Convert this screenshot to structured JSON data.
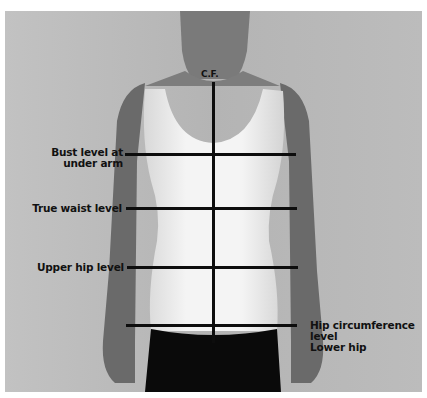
{
  "diagram": {
    "center_front_label": "C.F.",
    "levels": [
      {
        "id": "bust",
        "label_lines": [
          "Bust level at",
          "under arm"
        ]
      },
      {
        "id": "waist",
        "label_lines": [
          "True waist level"
        ]
      },
      {
        "id": "upper_hip",
        "label_lines": [
          "Upper hip level"
        ]
      },
      {
        "id": "hip",
        "label_lines": [
          "Hip circumference",
          "level",
          "Lower hip"
        ]
      }
    ]
  },
  "colors": {
    "background": "#bdbdbd",
    "line": "#0d0d0d",
    "top": "#f2f2f2",
    "skin": "#6e6e6e",
    "pants": "#0a0a0a"
  }
}
